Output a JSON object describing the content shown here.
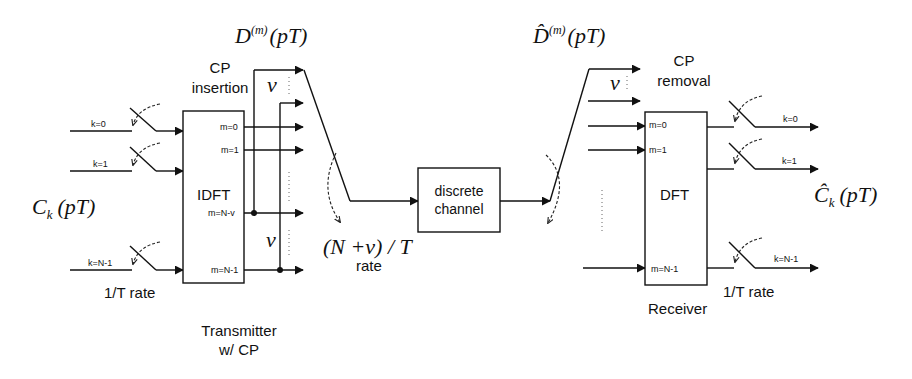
{
  "diagram": {
    "transmitter": {
      "input_symbol": "C",
      "input_symbol_sub": "k",
      "input_symbol_arg": "(pT)",
      "inputs": [
        "k=0",
        "k=1",
        "k=N-1"
      ],
      "input_rate": "1/T rate",
      "block": "IDFT",
      "outputs": [
        "m=0",
        "m=1",
        "m=N-v",
        "m=N-1"
      ],
      "cp_label_line1": "CP",
      "cp_label_line2": "insertion",
      "nu_symbol": "v",
      "caption_line1": "Transmitter",
      "caption_line2": "w/ CP"
    },
    "serial": {
      "tx_signal": "D",
      "tx_signal_sup": "(m)",
      "tx_signal_arg": "(pT)",
      "rate_expr": "(N +v) / T",
      "rate_word": "rate"
    },
    "channel": {
      "line1": "discrete",
      "line2": "channel"
    },
    "receiver": {
      "rx_signal": "D̂",
      "rx_signal_sup": "(m)",
      "rx_signal_arg": "(pT)",
      "cp_label_line1": "CP",
      "cp_label_line2": "removal",
      "nu_symbol": "v",
      "block": "DFT",
      "inputs": [
        "m=0",
        "m=1",
        "m=N-1"
      ],
      "outputs": [
        "k=0",
        "k=1",
        "k=N-1"
      ],
      "output_rate": "1/T rate",
      "output_symbol": "Ĉ",
      "output_symbol_sub": "k",
      "output_symbol_arg": "(pT)",
      "caption": "Receiver"
    }
  }
}
